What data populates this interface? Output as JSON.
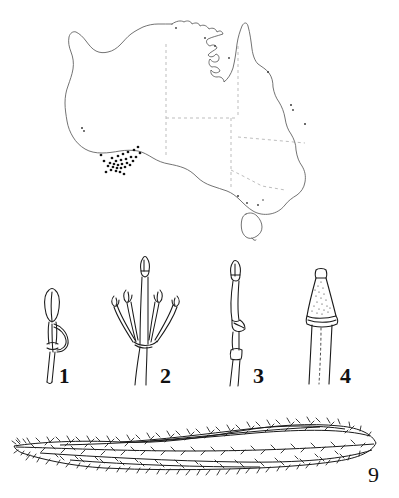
{
  "plate": {
    "name": "botanical-distribution-plate",
    "background_color": "#ffffff",
    "ink_color": "#1a1a1a",
    "border_color": "#9a9a9a",
    "width": 399,
    "height": 498
  },
  "map": {
    "name": "australia-distribution-map",
    "region": "Australia",
    "outline_color": "#555555",
    "state_border_style": "dashed",
    "state_border_color": "#b0b0b0",
    "dot_color": "#1a1a1a",
    "dot_count": 31,
    "dot_cluster_region": "south-west Western Australia",
    "includes_tasmania": true
  },
  "figures": [
    {
      "id": "fig-1",
      "label": "1",
      "description": "anther with elongate loop-shaped appendage on slender filament"
    },
    {
      "id": "fig-2",
      "label": "2",
      "description": "androecium with central style and four recurved stamens bearing dark anthers"
    },
    {
      "id": "fig-3",
      "label": "3",
      "description": "slender filament with basal node and narrow apical anther"
    },
    {
      "id": "fig-4",
      "label": "4",
      "description": "conical stippled anther on stout filament"
    },
    {
      "id": "fig-9",
      "label": "9",
      "description": "elongate lanceolate hairy leaf or pod with dense indumentum"
    }
  ]
}
